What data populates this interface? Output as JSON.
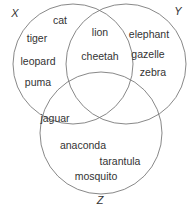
{
  "diagram": {
    "type": "venn",
    "sets": [
      {
        "id": "X",
        "label": "X"
      },
      {
        "id": "Y",
        "label": "Y"
      },
      {
        "id": "Z",
        "label": "Z"
      }
    ],
    "regions": {
      "X_only": [
        "cat",
        "tiger",
        "leopard",
        "puma"
      ],
      "X_and_Y": [
        "lion",
        "cheetah"
      ],
      "Y_only": [
        "elephant",
        "gazelle",
        "zebra"
      ],
      "X_and_Z": [
        "jaguar"
      ],
      "Z_only": [
        "anaconda",
        "tarantula",
        "mosquito"
      ]
    },
    "colors": {
      "stroke": "#7a7a7a",
      "text": "#333333",
      "background": "#ffffff"
    }
  }
}
